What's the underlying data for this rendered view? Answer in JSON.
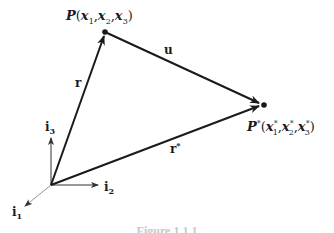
{
  "figure": {
    "points": {
      "P": {
        "name": "P",
        "coords": [
          "x",
          "x",
          "x"
        ],
        "subs": [
          "1",
          "2",
          "3"
        ],
        "star": ""
      },
      "P_star": {
        "name": "P",
        "star": "*",
        "coords": [
          "x",
          "x",
          "x"
        ],
        "subs": [
          "1",
          "2",
          "3"
        ]
      }
    },
    "vectors": {
      "r": "r",
      "r_star": "r",
      "r_star_sup": "*",
      "u": "u"
    },
    "axes": {
      "i1": {
        "base": "i",
        "sub": "1"
      },
      "i2": {
        "base": "i",
        "sub": "2"
      },
      "i3": {
        "base": "i",
        "sub": "3"
      }
    },
    "caption": "Figure 1.1.1",
    "colors": {
      "stroke": "#1a1a1a",
      "axis": "#333333",
      "background": "#ffffff"
    }
  }
}
